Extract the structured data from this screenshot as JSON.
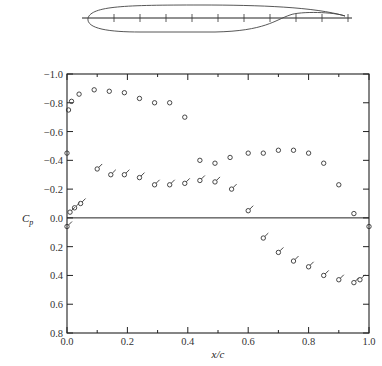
{
  "chart_data": {
    "type": "scatter",
    "title": "",
    "xlabel": "x/c",
    "ylabel": "C_p",
    "xlim": [
      0.0,
      1.0
    ],
    "ylim": [
      -1.0,
      0.8
    ],
    "y_inverted": true,
    "grid": false,
    "x_ticks": [
      "0.0",
      "0.2",
      "0.4",
      "0.6",
      "0.8",
      "1.0"
    ],
    "x_tick_values": [
      0.0,
      0.2,
      0.4,
      0.6,
      0.8,
      1.0
    ],
    "y_ticks": [
      "-1.0",
      "-0.8",
      "-0.6",
      "-0.4",
      "-0.2",
      "0.0",
      "0.2",
      "0.4",
      "0.6",
      "0.8"
    ],
    "y_tick_values": [
      -1.0,
      -0.8,
      -0.6,
      -0.4,
      -0.2,
      0.0,
      0.2,
      0.4,
      0.6,
      0.8
    ],
    "zero_line": 0.0,
    "inset": "airfoil profile with chordline and pressure tap marks",
    "series": [
      {
        "name": "upper surface",
        "marker": "open-circle",
        "x": [
          0.0,
          0.005,
          0.015,
          0.04,
          0.09,
          0.14,
          0.19,
          0.24,
          0.29,
          0.34,
          0.39,
          0.44,
          0.49,
          0.54,
          0.6,
          0.65,
          0.7,
          0.75,
          0.8,
          0.85,
          0.9,
          0.95,
          1.0
        ],
        "y": [
          -0.45,
          -0.75,
          -0.81,
          -0.86,
          -0.89,
          -0.88,
          -0.87,
          -0.83,
          -0.8,
          -0.8,
          -0.7,
          -0.4,
          -0.38,
          -0.42,
          -0.45,
          -0.45,
          -0.47,
          -0.47,
          -0.45,
          -0.38,
          -0.23,
          -0.03,
          0.06
        ]
      },
      {
        "name": "lower surface",
        "marker": "flagged-circle",
        "x": [
          0.0,
          0.01,
          0.025,
          0.045,
          0.1,
          0.145,
          0.19,
          0.24,
          0.29,
          0.34,
          0.39,
          0.44,
          0.49,
          0.545,
          0.6,
          0.65,
          0.7,
          0.75,
          0.8,
          0.85,
          0.9,
          0.95,
          0.97
        ],
        "y": [
          0.06,
          -0.04,
          -0.07,
          -0.1,
          -0.34,
          -0.3,
          -0.3,
          -0.28,
          -0.23,
          -0.23,
          -0.24,
          -0.26,
          -0.25,
          -0.2,
          -0.05,
          0.14,
          0.24,
          0.3,
          0.34,
          0.4,
          0.43,
          0.45,
          0.43
        ]
      }
    ]
  }
}
